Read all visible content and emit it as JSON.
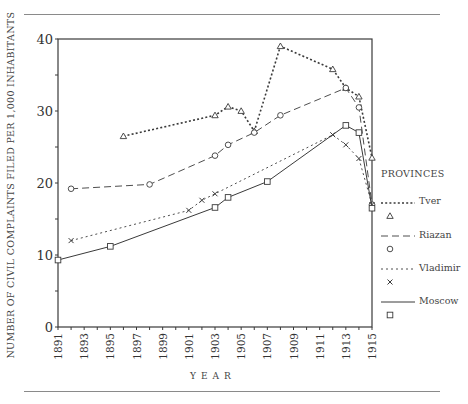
{
  "chart_data": {
    "type": "line",
    "title": "",
    "xlabel": "YEAR",
    "ylabel": "NUMBER OF CIVIL COMPLAINTS FILED PER 1,000 INHABITANTS",
    "xlim": [
      1891,
      1915
    ],
    "ylim": [
      0,
      40
    ],
    "x_ticks": [
      "1891",
      "1893",
      "1895",
      "1897",
      "1899",
      "1901",
      "1903",
      "1905",
      "1907",
      "1909",
      "1911",
      "1913",
      "1915"
    ],
    "y_ticks": [
      "0",
      "10",
      "20",
      "30",
      "40"
    ],
    "grid": false,
    "legend_title": "PROVINCES",
    "legend_position": "right",
    "series": [
      {
        "name": "Tver",
        "marker": "triangle",
        "style": "dotted-heavy",
        "points": [
          [
            1896,
            26.5
          ],
          [
            1903,
            29.4
          ],
          [
            1904,
            30.6
          ],
          [
            1905,
            30.0
          ],
          [
            1906,
            27.2
          ],
          [
            1908,
            39.0
          ],
          [
            1912,
            35.8
          ],
          [
            1913,
            33.2
          ],
          [
            1914,
            32.0
          ],
          [
            1915,
            23.5
          ]
        ]
      },
      {
        "name": "Riazan",
        "marker": "circle",
        "style": "dashed",
        "points": [
          [
            1892,
            19.2
          ],
          [
            1898,
            19.8
          ],
          [
            1903,
            23.8
          ],
          [
            1904,
            25.3
          ],
          [
            1906,
            27.0
          ],
          [
            1908,
            29.4
          ],
          [
            1913,
            33.2
          ],
          [
            1914,
            30.5
          ],
          [
            1915,
            17.0
          ]
        ]
      },
      {
        "name": "Vladimir",
        "marker": "x",
        "style": "dotted-light",
        "points": [
          [
            1892,
            12.0
          ],
          [
            1901,
            16.2
          ],
          [
            1902,
            17.6
          ],
          [
            1903,
            18.5
          ],
          [
            1912,
            26.7
          ],
          [
            1913,
            25.3
          ],
          [
            1914,
            23.4
          ],
          [
            1915,
            17.0
          ]
        ]
      },
      {
        "name": "Moscow",
        "marker": "square",
        "style": "solid",
        "points": [
          [
            1891,
            9.3
          ],
          [
            1895,
            11.2
          ],
          [
            1903,
            16.6
          ],
          [
            1904,
            18.0
          ],
          [
            1907,
            20.2
          ],
          [
            1913,
            28.0
          ],
          [
            1914,
            27.0
          ],
          [
            1915,
            16.5
          ]
        ]
      }
    ]
  },
  "legend": {
    "title": "PROVINCES",
    "items": [
      {
        "label": "Tver",
        "marker": "△"
      },
      {
        "label": "Riazan",
        "marker": "○"
      },
      {
        "label": "Vladimir",
        "marker": "×"
      },
      {
        "label": "Moscow",
        "marker": "□"
      }
    ]
  }
}
